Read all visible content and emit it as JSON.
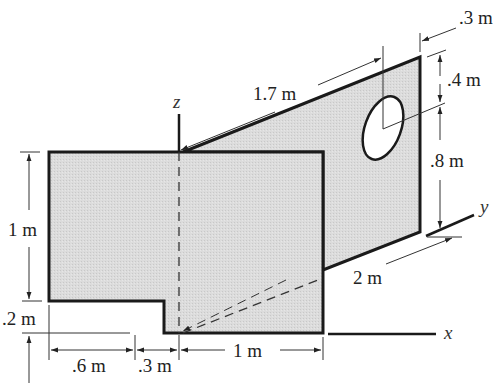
{
  "figure": {
    "colors": {
      "plate_fill": "#d9d9d9",
      "outline": "#1a1a1a",
      "dimension_line": "#333333",
      "background": "#ffffff"
    }
  },
  "axes": {
    "x": "x",
    "y": "y",
    "z": "z"
  },
  "dimensions": {
    "slant_top": "1.7 m",
    "hole_offset_right": ".3 m",
    "hole_top": ".4 m",
    "hole_bottom": ".8 m",
    "depth_y": "2 m",
    "left_height": "1 m",
    "step_height": ".2 m",
    "bottom_left": ".6 m",
    "bottom_mid": ".3 m",
    "bottom_right": "1 m"
  }
}
